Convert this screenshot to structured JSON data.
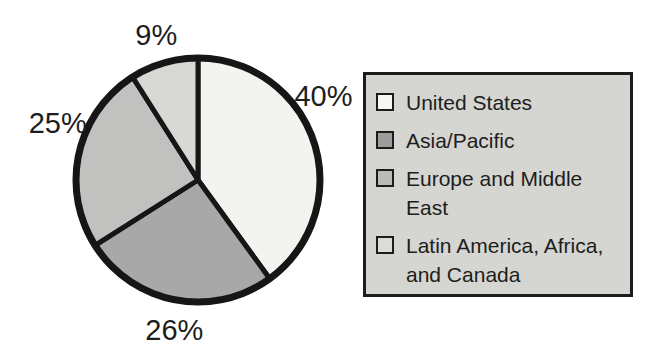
{
  "chart_data": {
    "type": "pie",
    "title": "",
    "categories": [
      "United States",
      "Asia/Pacific",
      "Europe and Middle East",
      "Latin America, Africa, and Canada"
    ],
    "values": [
      40,
      26,
      25,
      9
    ],
    "slices": [
      {
        "label": "United States",
        "value": 40,
        "display": "40%",
        "color": "#f3f3f0",
        "swatch_color": "#f6f6f4"
      },
      {
        "label": "Asia/Pacific",
        "value": 26,
        "display": "26%",
        "color": "#a8a8a8",
        "swatch_color": "#9d9d9d"
      },
      {
        "label": "Europe and Middle East",
        "value": 25,
        "display": "25%",
        "color": "#c1c1c0",
        "swatch_color": "#bbbbba"
      },
      {
        "label": "Latin America, Africa, and Canada",
        "value": 9,
        "display": "9%",
        "color": "#d8d8d5",
        "swatch_color": "#dbdbd8"
      }
    ],
    "start_angle_deg": 0,
    "direction": "clockwise",
    "legend_position": "right",
    "outline_color": "#161616",
    "label_color": "#1d1d1d",
    "label_angles_deg": [
      56,
      189,
      292,
      344
    ],
    "label_radius_factor": 1.24,
    "geometry": {
      "cx": 198,
      "cy": 180,
      "r": 122
    }
  },
  "legend": {
    "background": "#d5d5d2",
    "border_color": "#1c1c1c"
  }
}
